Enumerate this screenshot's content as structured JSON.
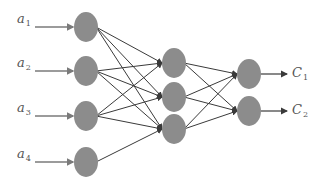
{
  "diagram": {
    "title": "",
    "type": "feedforward-neural-network",
    "colors": {
      "node": "#8c8c8c",
      "edge": "#3a3a3a",
      "input_arrow": "#7a7a7a",
      "label": "#555555"
    },
    "inputs": [
      {
        "base": "a",
        "sub": "1",
        "y": 27
      },
      {
        "base": "a",
        "sub": "2",
        "y": 71
      },
      {
        "base": "a",
        "sub": "3",
        "y": 116
      },
      {
        "base": "a",
        "sub": "4",
        "y": 162
      }
    ],
    "layers": [
      {
        "name": "input",
        "x": 86,
        "nodes": [
          27,
          71,
          116,
          162
        ]
      },
      {
        "name": "hidden",
        "x": 174,
        "nodes": [
          63,
          97,
          129
        ]
      },
      {
        "name": "output",
        "x": 249,
        "nodes": [
          74,
          111
        ]
      }
    ],
    "connections": {
      "input_to_hidden": [
        [
          0,
          0
        ],
        [
          0,
          1
        ],
        [
          0,
          2
        ],
        [
          1,
          0
        ],
        [
          1,
          1
        ],
        [
          1,
          2
        ],
        [
          2,
          0
        ],
        [
          2,
          1
        ],
        [
          2,
          2
        ],
        [
          3,
          2
        ]
      ],
      "hidden_to_output": [
        [
          0,
          0
        ],
        [
          0,
          1
        ],
        [
          1,
          0
        ],
        [
          1,
          1
        ],
        [
          2,
          0
        ],
        [
          2,
          1
        ]
      ]
    },
    "outputs": [
      {
        "base": "C",
        "sub": "1",
        "y": 74
      },
      {
        "base": "C",
        "sub": "2",
        "y": 111
      }
    ]
  }
}
